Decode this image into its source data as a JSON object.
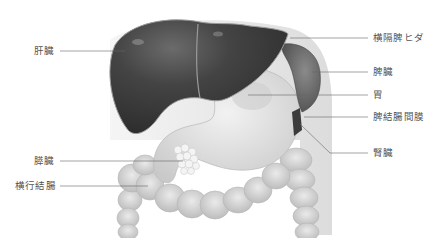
{
  "diagram": {
    "colors": {
      "liver": "#3a3a3a",
      "liver_highlight": "#6a6a6a",
      "spleen": "#5a5a5a",
      "stomach": "#d8d8d8",
      "colon": "#cfcfcf",
      "pancreas": "#eeeeee",
      "peritoneum": "#e2e2e2",
      "leader_line": "#666666",
      "label_text": "#555555"
    },
    "labels_left": [
      {
        "id": "liver",
        "text": "肝臓"
      },
      {
        "id": "pancreas",
        "text": "膵臓"
      },
      {
        "id": "transverse-colon",
        "text": "横行結腸"
      }
    ],
    "labels_right": [
      {
        "id": "phrenicosplenic-ligament",
        "text": "横隔脾ヒダ"
      },
      {
        "id": "spleen",
        "text": "脾臓"
      },
      {
        "id": "stomach",
        "text": "胃"
      },
      {
        "id": "splenocolic-ligament",
        "text": "脾結腸間膜"
      },
      {
        "id": "kidney",
        "text": "腎臓"
      }
    ]
  }
}
